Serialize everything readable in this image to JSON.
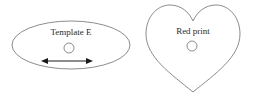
{
  "canvas": {
    "width": 254,
    "height": 99,
    "background_color": "#ffffff",
    "outline_color": "#6f6f6f",
    "text_color": "#2b2b2b",
    "arrow_color": "#1a1a1a"
  },
  "shapes": [
    {
      "id": "ellipse-template",
      "kind": "ellipse",
      "label": "Template E",
      "label_x": 71,
      "label_y": 35,
      "center_x": 71,
      "center_y": 45,
      "radius_x": 59,
      "radius_y": 24,
      "hole": {
        "center_x": 69,
        "center_y": 48,
        "radius": 5
      },
      "arrow": {
        "icon": "double-headed-arrow-icon",
        "x1": 41,
        "x2": 93,
        "y": 61
      }
    },
    {
      "id": "heart-red-print",
      "kind": "heart",
      "label": "Red print",
      "label_x": 193,
      "label_y": 34,
      "center_x": 193,
      "center_y": 48,
      "hole": {
        "center_x": 192,
        "center_y": 46,
        "radius": 5
      },
      "path": "M 193 92 C 171 74 146 57 146 34 C 146 17 157 5 170 5 C 181 5 189 12 193 21 C 197 12 205 5 216 5 C 229 5 240 17 240 34 C 240 57 215 74 193 92 Z"
    }
  ]
}
